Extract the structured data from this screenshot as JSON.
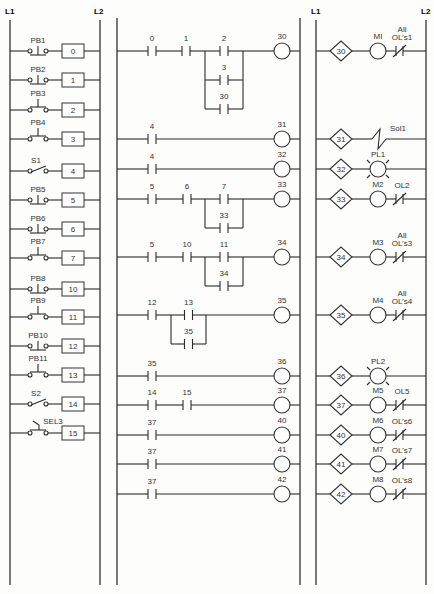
{
  "rail_labels": {
    "left_L1": "L1",
    "left_L2": "L2",
    "right_L1": "L1",
    "right_L2": "L2"
  },
  "inputs": [
    {
      "label": "PB1",
      "address": "0",
      "type": "pb_no_top",
      "y": 51
    },
    {
      "label": "PB2",
      "address": "1",
      "type": "pb_no_top",
      "y": 80
    },
    {
      "label": "PB3",
      "address": "2",
      "type": "pb_nc",
      "y": 110
    },
    {
      "label": "PB4",
      "address": "3",
      "type": "pb_nc",
      "y": 139
    },
    {
      "label": "S1",
      "address": "4",
      "type": "switch",
      "y": 171
    },
    {
      "label": "PB5",
      "address": "5",
      "type": "pb_no_top",
      "y": 200
    },
    {
      "label": "PB6",
      "address": "6",
      "type": "pb_no_top",
      "y": 229
    },
    {
      "label": "PB7",
      "address": "7",
      "type": "pb_nc",
      "y": 258
    },
    {
      "label": "PB8",
      "address": "10",
      "type": "pb_no_top",
      "y": 289
    },
    {
      "label": "PB9",
      "address": "11",
      "type": "pb_nc",
      "y": 317
    },
    {
      "label": "PB10",
      "address": "12",
      "type": "pb_no_top",
      "y": 346
    },
    {
      "label": "PB11",
      "address": "13",
      "type": "pb_nc",
      "y": 375
    },
    {
      "label": "S2",
      "address": "14",
      "type": "switch",
      "y": 404
    },
    {
      "label": "SEL3",
      "address": "15",
      "type": "selector",
      "y": 433
    }
  ],
  "logic_rungs": [
    {
      "y": 51,
      "coil": "30",
      "series": [
        {
          "addr": "0",
          "x": 152
        },
        {
          "addr": "1",
          "x": 186
        }
      ],
      "branch": {
        "x1": 205,
        "x2": 243,
        "contacts": [
          {
            "addr": "2",
            "dy": 0
          },
          {
            "addr": "3",
            "dy": 29
          },
          {
            "addr": "30",
            "dy": 58
          }
        ]
      }
    },
    {
      "y": 139,
      "coil": "31",
      "series": [
        {
          "addr": "4",
          "x": 152
        }
      ]
    },
    {
      "y": 169,
      "coil": "32",
      "series": [
        {
          "addr": "4",
          "x": 152
        }
      ]
    },
    {
      "y": 199,
      "coil": "33",
      "series": [
        {
          "addr": "5",
          "x": 152
        },
        {
          "addr": "6",
          "x": 187
        }
      ],
      "branch": {
        "x1": 205,
        "x2": 243,
        "contacts": [
          {
            "addr": "7",
            "dy": 0
          },
          {
            "addr": "33",
            "dy": 29
          }
        ]
      }
    },
    {
      "y": 257,
      "coil": "34",
      "series": [
        {
          "addr": "5",
          "x": 152
        },
        {
          "addr": "10",
          "x": 187
        }
      ],
      "branch": {
        "x1": 205,
        "x2": 243,
        "contacts": [
          {
            "addr": "11",
            "dy": 0
          },
          {
            "addr": "34",
            "dy": 29
          }
        ]
      }
    },
    {
      "y": 315,
      "coil": "35",
      "series": [
        {
          "addr": "12",
          "x": 152
        }
      ],
      "branch": {
        "x1": 171,
        "x2": 206,
        "contacts": [
          {
            "addr": "13",
            "dy": 0
          },
          {
            "addr": "35",
            "dy": 29
          }
        ]
      }
    },
    {
      "y": 376,
      "coil": "36",
      "series": [
        {
          "addr": "35",
          "x": 152
        }
      ]
    },
    {
      "y": 405,
      "coil": "37",
      "series": [
        {
          "addr": "14",
          "x": 152
        },
        {
          "addr": "15",
          "x": 187
        }
      ]
    },
    {
      "y": 435,
      "coil": "40",
      "series": [
        {
          "addr": "37",
          "x": 152
        }
      ]
    },
    {
      "y": 464,
      "coil": "41",
      "series": [
        {
          "addr": "37",
          "x": 152
        }
      ]
    },
    {
      "y": 494,
      "coil": "42",
      "series": [
        {
          "addr": "37",
          "x": 152
        }
      ]
    }
  ],
  "outputs": [
    {
      "address": "30",
      "device": "MI",
      "device_type": "motor",
      "overload": "All\nOL's1",
      "y": 51
    },
    {
      "address": "31",
      "device": "Sol1",
      "device_type": "solenoid",
      "overload": "",
      "y": 139
    },
    {
      "address": "32",
      "device": "PL1",
      "device_type": "pilot_light",
      "overload": "",
      "y": 169
    },
    {
      "address": "33",
      "device": "M2",
      "device_type": "motor",
      "overload": "OL2",
      "y": 199
    },
    {
      "address": "34",
      "device": "M3",
      "device_type": "motor",
      "overload": "All\nOL's3",
      "y": 257
    },
    {
      "address": "35",
      "device": "M4",
      "device_type": "motor",
      "overload": "All\nOL's4",
      "y": 315
    },
    {
      "address": "36",
      "device": "PL2",
      "device_type": "pilot_light",
      "overload": "",
      "y": 376
    },
    {
      "address": "37",
      "device": "M5",
      "device_type": "motor",
      "overload": "OL5",
      "y": 405
    },
    {
      "address": "40",
      "device": "M6",
      "device_type": "motor",
      "overload": "OL's6",
      "y": 435
    },
    {
      "address": "41",
      "device": "M7",
      "device_type": "motor",
      "overload": "OL's7",
      "y": 464
    },
    {
      "address": "42",
      "device": "M8",
      "device_type": "motor",
      "overload": "OL's8",
      "y": 494
    }
  ],
  "colors": {
    "line": "#2b2b2b",
    "background": "#fdfdfc"
  }
}
